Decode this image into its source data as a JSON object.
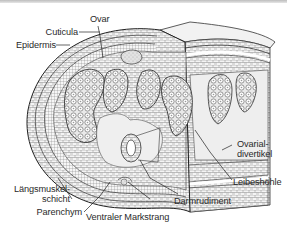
{
  "diagram": {
    "type": "biological cross-section illustration",
    "labels": {
      "ovar": "Ovar",
      "cuticula": "Cuticula",
      "epidermis": "Epidermis",
      "ovarial_line1": "Ovarial-",
      "ovarial_line2": "divertikel",
      "laengsmuskel_line1": "Längsmuskel-",
      "laengsmuskel_line2": "schicht",
      "parenchym": "Parenchym",
      "ventraler_markstrang": "Ventraler Markstrang",
      "darmrudiment": "Darmrudiment",
      "leibeshoehle": "Leibeshöhle"
    },
    "colors": {
      "ink": "#2a2a2a",
      "shade": "#d9d9d9",
      "light": "#efefef",
      "background": "#ffffff"
    }
  }
}
